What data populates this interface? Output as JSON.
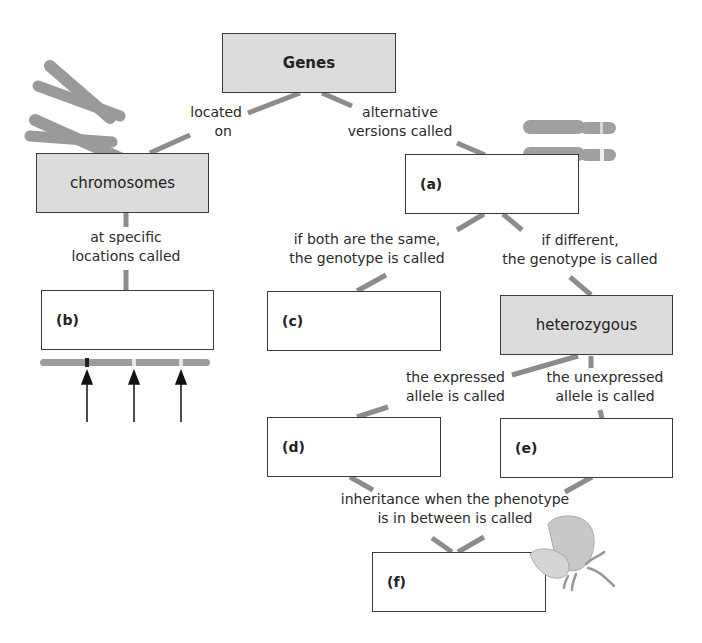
{
  "diagram": {
    "type": "concept-map",
    "colors": {
      "filled_box": "#dcdcdc",
      "box_border": "#3a3a3a",
      "connector": "#8c8c8c",
      "chromosome": "#9a9a9a",
      "text": "#2a2a2a"
    },
    "nodes": {
      "genes": {
        "label": "Genes",
        "style": "filled-bold"
      },
      "chromosomes": {
        "label": "chromosomes",
        "style": "filled"
      },
      "a": {
        "label": "(a)",
        "style": "blank"
      },
      "b": {
        "label": "(b)",
        "style": "blank"
      },
      "c": {
        "label": "(c)",
        "style": "blank"
      },
      "heterozygous": {
        "label": "heterozygous",
        "style": "filled"
      },
      "d": {
        "label": "(d)",
        "style": "blank"
      },
      "e": {
        "label": "(e)",
        "style": "blank"
      },
      "f": {
        "label": "(f)",
        "style": "blank"
      }
    },
    "links": {
      "located_on": {
        "line1": "located",
        "line2": "on",
        "from": "genes",
        "to": "chromosomes"
      },
      "alternative_versions": {
        "line1": "alternative",
        "line2": "versions called",
        "from": "genes",
        "to": "a"
      },
      "specific_locations": {
        "line1": "at specific",
        "line2": "locations called",
        "from": "chromosomes",
        "to": "b"
      },
      "both_same": {
        "line1": "if both are the same,",
        "line2": "the genotype is called",
        "from": "a",
        "to": "c"
      },
      "different": {
        "line1": "if different,",
        "line2": "the genotype is called",
        "from": "a",
        "to": "heterozygous"
      },
      "expressed": {
        "line1": "the expressed",
        "line2": "allele is called",
        "from": "heterozygous",
        "to": "d"
      },
      "unexpressed": {
        "line1": "the unexpressed",
        "line2": "allele is called",
        "from": "heterozygous",
        "to": "e"
      },
      "in_between": {
        "line1": "inheritance when the phenotype",
        "line2": "is in between is called",
        "from": [
          "d",
          "e"
        ],
        "to": "f"
      }
    },
    "illustrations": {
      "chromosome_pair": "chromosome-x-icon",
      "homologous_chromosomes": "homologous-chromosomes-icon",
      "gene_locus_chromosome": "chromosome-loci-icon",
      "flower": "flower-petal-icon"
    }
  }
}
